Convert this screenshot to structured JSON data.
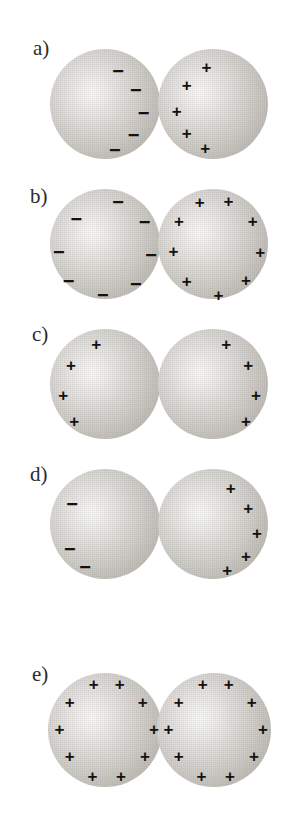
{
  "figure": {
    "background_color": "#ffffff",
    "sphere_fill_light": "#fbfbfa",
    "sphere_fill_dark": "#a9a59d",
    "charge_color": "#14110f",
    "label_color": "#2b2b2b",
    "plus_symbol": "+",
    "minus_symbol": "−",
    "panels": [
      {
        "label": "a)",
        "label_x": 33,
        "label_y": 38,
        "top": 40,
        "spheres": [
          {
            "name": "left-sphere",
            "cx": 105,
            "cy": 64,
            "r": 55,
            "charge_sign": "minus",
            "charge_count": 5,
            "distribution": "inner-edge-right",
            "charges": [
              {
                "sign": "minus",
                "x": 0.62,
                "y": 0.2
              },
              {
                "sign": "minus",
                "x": 0.78,
                "y": 0.37
              },
              {
                "sign": "minus",
                "x": 0.85,
                "y": 0.58
              },
              {
                "sign": "minus",
                "x": 0.76,
                "y": 0.78
              },
              {
                "sign": "minus",
                "x": 0.59,
                "y": 0.92
              }
            ]
          },
          {
            "name": "right-sphere",
            "cx": 213,
            "cy": 64,
            "r": 55,
            "charge_sign": "plus",
            "charge_count": 5,
            "distribution": "inner-edge-left",
            "charges": [
              {
                "sign": "plus",
                "x": 0.44,
                "y": 0.16
              },
              {
                "sign": "plus",
                "x": 0.26,
                "y": 0.33
              },
              {
                "sign": "plus",
                "x": 0.17,
                "y": 0.56
              },
              {
                "sign": "plus",
                "x": 0.26,
                "y": 0.76
              },
              {
                "sign": "plus",
                "x": 0.43,
                "y": 0.9
              }
            ]
          }
        ]
      },
      {
        "label": "b)",
        "label_x": 30,
        "label_y": 186,
        "top": 180,
        "spheres": [
          {
            "name": "left-sphere",
            "cx": 105,
            "cy": 64,
            "r": 55,
            "charge_sign": "minus",
            "charge_count": 8,
            "distribution": "uniform-perimeter",
            "charges": [
              {
                "sign": "minus",
                "x": 0.62,
                "y": 0.12
              },
              {
                "sign": "minus",
                "x": 0.86,
                "y": 0.3
              },
              {
                "sign": "minus",
                "x": 0.92,
                "y": 0.6
              },
              {
                "sign": "minus",
                "x": 0.78,
                "y": 0.86
              },
              {
                "sign": "minus",
                "x": 0.48,
                "y": 0.96
              },
              {
                "sign": "minus",
                "x": 0.17,
                "y": 0.84
              },
              {
                "sign": "minus",
                "x": 0.08,
                "y": 0.57
              },
              {
                "sign": "minus",
                "x": 0.24,
                "y": 0.27
              }
            ]
          },
          {
            "name": "right-sphere",
            "cx": 213,
            "cy": 64,
            "r": 55,
            "charge_sign": "plus",
            "charge_count": 8,
            "distribution": "uniform-perimeter",
            "charges": [
              {
                "sign": "plus",
                "x": 0.38,
                "y": 0.12
              },
              {
                "sign": "plus",
                "x": 0.64,
                "y": 0.11
              },
              {
                "sign": "plus",
                "x": 0.86,
                "y": 0.29
              },
              {
                "sign": "plus",
                "x": 0.93,
                "y": 0.57
              },
              {
                "sign": "plus",
                "x": 0.8,
                "y": 0.83
              },
              {
                "sign": "plus",
                "x": 0.55,
                "y": 0.96
              },
              {
                "sign": "plus",
                "x": 0.26,
                "y": 0.84
              },
              {
                "sign": "plus",
                "x": 0.14,
                "y": 0.56
              },
              {
                "sign": "plus",
                "x": 0.19,
                "y": 0.29
              }
            ]
          }
        ]
      },
      {
        "label": "c)",
        "label_x": 32,
        "label_y": 324,
        "top": 320,
        "spheres": [
          {
            "name": "left-sphere",
            "cx": 105,
            "cy": 64,
            "r": 55,
            "charge_sign": "plus",
            "charge_count": 4,
            "distribution": "outer-edge-left",
            "charges": [
              {
                "sign": "plus",
                "x": 0.42,
                "y": 0.14
              },
              {
                "sign": "plus",
                "x": 0.19,
                "y": 0.33
              },
              {
                "sign": "plus",
                "x": 0.12,
                "y": 0.6
              },
              {
                "sign": "plus",
                "x": 0.22,
                "y": 0.84
              }
            ]
          },
          {
            "name": "right-sphere",
            "cx": 213,
            "cy": 64,
            "r": 55,
            "charge_sign": "plus",
            "charge_count": 4,
            "distribution": "outer-edge-right",
            "charges": [
              {
                "sign": "plus",
                "x": 0.62,
                "y": 0.14
              },
              {
                "sign": "plus",
                "x": 0.82,
                "y": 0.33
              },
              {
                "sign": "plus",
                "x": 0.89,
                "y": 0.6
              },
              {
                "sign": "plus",
                "x": 0.8,
                "y": 0.84
              }
            ]
          }
        ]
      },
      {
        "label": "d)",
        "label_x": 30,
        "label_y": 464,
        "top": 460,
        "spheres": [
          {
            "name": "left-sphere",
            "cx": 105,
            "cy": 64,
            "r": 55,
            "charge_sign": "minus",
            "charge_count": 3,
            "distribution": "outer-edge-left",
            "charges": [
              {
                "sign": "minus",
                "x": 0.2,
                "y": 0.32
              },
              {
                "sign": "minus",
                "x": 0.18,
                "y": 0.73
              },
              {
                "sign": "minus",
                "x": 0.32,
                "y": 0.89
              }
            ]
          },
          {
            "name": "right-sphere",
            "cx": 213,
            "cy": 64,
            "r": 55,
            "charge_sign": "plus",
            "charge_count": 5,
            "distribution": "outer-edge-right",
            "charges": [
              {
                "sign": "plus",
                "x": 0.66,
                "y": 0.17
              },
              {
                "sign": "plus",
                "x": 0.82,
                "y": 0.35
              },
              {
                "sign": "plus",
                "x": 0.9,
                "y": 0.58
              },
              {
                "sign": "plus",
                "x": 0.8,
                "y": 0.79
              },
              {
                "sign": "plus",
                "x": 0.63,
                "y": 0.92
              }
            ]
          }
        ]
      },
      {
        "label": "e)",
        "label_x": 32,
        "label_y": 664,
        "top": 660,
        "spheres": [
          {
            "name": "left-sphere",
            "cx": 105,
            "cy": 70,
            "r": 57,
            "charge_sign": "plus",
            "charge_count": 10,
            "distribution": "uniform-perimeter",
            "charges": [
              {
                "sign": "plus",
                "x": 0.4,
                "y": 0.1
              },
              {
                "sign": "plus",
                "x": 0.63,
                "y": 0.1
              },
              {
                "sign": "plus",
                "x": 0.83,
                "y": 0.25
              },
              {
                "sign": "plus",
                "x": 0.93,
                "y": 0.49
              },
              {
                "sign": "plus",
                "x": 0.85,
                "y": 0.73
              },
              {
                "sign": "plus",
                "x": 0.64,
                "y": 0.9
              },
              {
                "sign": "plus",
                "x": 0.39,
                "y": 0.9
              },
              {
                "sign": "plus",
                "x": 0.19,
                "y": 0.73
              },
              {
                "sign": "plus",
                "x": 0.1,
                "y": 0.49
              },
              {
                "sign": "plus",
                "x": 0.19,
                "y": 0.25
              }
            ]
          },
          {
            "name": "right-sphere",
            "cx": 214,
            "cy": 70,
            "r": 57,
            "charge_sign": "plus",
            "charge_count": 10,
            "distribution": "uniform-perimeter",
            "charges": [
              {
                "sign": "plus",
                "x": 0.4,
                "y": 0.1
              },
              {
                "sign": "plus",
                "x": 0.63,
                "y": 0.1
              },
              {
                "sign": "plus",
                "x": 0.83,
                "y": 0.25
              },
              {
                "sign": "plus",
                "x": 0.93,
                "y": 0.49
              },
              {
                "sign": "plus",
                "x": 0.85,
                "y": 0.73
              },
              {
                "sign": "plus",
                "x": 0.64,
                "y": 0.9
              },
              {
                "sign": "plus",
                "x": 0.39,
                "y": 0.9
              },
              {
                "sign": "plus",
                "x": 0.19,
                "y": 0.73
              },
              {
                "sign": "plus",
                "x": 0.1,
                "y": 0.49
              },
              {
                "sign": "plus",
                "x": 0.19,
                "y": 0.25
              }
            ]
          }
        ]
      }
    ]
  }
}
